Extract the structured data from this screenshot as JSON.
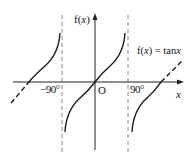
{
  "diagram": {
    "y_axis_label_pre": "f(",
    "y_axis_label_var": "x",
    "y_axis_label_post": ")",
    "x_axis_label": "x",
    "origin_label": "O",
    "tick_left": "−90°",
    "tick_right": "90°",
    "function_label_pre": "f(",
    "function_label_var": "x",
    "function_label_mid": ") = tan",
    "function_label_var2": "x",
    "colors": {
      "stroke": "#1a1a1a",
      "dash": "#777777"
    }
  }
}
